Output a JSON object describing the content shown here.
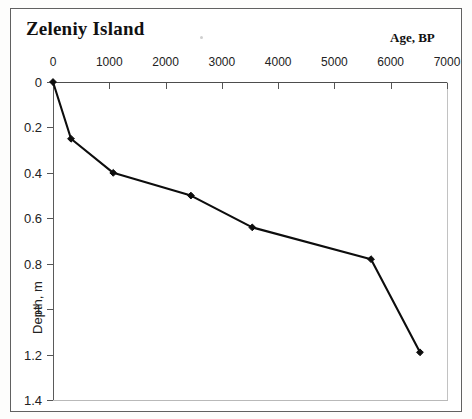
{
  "figure": {
    "title": "Zeleniy Island",
    "age_caption": "Age, BP"
  },
  "axes": {
    "x": {
      "label": "Age, BP",
      "position": "top",
      "ticks": [
        "0",
        "1000",
        "2000",
        "3000",
        "4000",
        "5000",
        "6000",
        "7000"
      ],
      "min": 0,
      "max": 7000
    },
    "y": {
      "label": "Depth, m",
      "position": "left",
      "inverted": true,
      "ticks": [
        "0",
        "0.2",
        "0.4",
        "0.6",
        "0.8",
        "1",
        "1.2",
        "1.4"
      ],
      "min": 0,
      "max": 1.4
    }
  },
  "chart_data": {
    "type": "line",
    "title": "Zeleniy Island",
    "subtitle": "",
    "xlabel": "Age, BP",
    "ylabel": "Depth, m",
    "xlim": [
      0,
      7000
    ],
    "ylim": [
      0,
      1.4
    ],
    "y_inverted": true,
    "x_axis_position": "top",
    "grid": false,
    "legend": null,
    "xticks": [
      0,
      1000,
      2000,
      3000,
      4000,
      5000,
      6000,
      7000
    ],
    "yticks": [
      0,
      0.2,
      0.4,
      0.6,
      0.8,
      1,
      1.2,
      1.4
    ],
    "marker": "diamond",
    "line_color": "#0d0d0d",
    "series": [
      {
        "name": "age-depth curve",
        "x": [
          0,
          320,
          1070,
          2450,
          3540,
          5650,
          6520
        ],
        "y": [
          0.0,
          0.25,
          0.4,
          0.5,
          0.64,
          0.78,
          1.19
        ]
      }
    ]
  },
  "colors": {
    "line": "#0d0d0d",
    "axis": "#555555",
    "box": "#c2c2c2",
    "frame": "#4a4a4a",
    "text": "#111111"
  }
}
